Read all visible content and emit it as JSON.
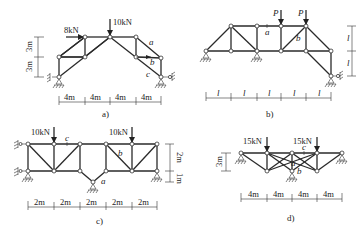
{
  "figure": {
    "panels": [
      {
        "id": "a",
        "caption": "a)",
        "loads": [
          {
            "label": "8kN",
            "direction": "horizontal-right"
          },
          {
            "label": "10kN",
            "direction": "down"
          }
        ],
        "member_labels": [
          "a",
          "b",
          "c"
        ],
        "horizontal_dims": [
          "4m",
          "4m",
          "4m",
          "4m"
        ],
        "vertical_dims": [
          "3m",
          "3m"
        ]
      },
      {
        "id": "b",
        "caption": "b)",
        "loads": [
          {
            "label": "P",
            "direction": "down"
          },
          {
            "label": "P",
            "direction": "down"
          }
        ],
        "member_labels": [
          "a",
          "b"
        ],
        "horizontal_dims": [
          "l",
          "l",
          "l",
          "l",
          "l"
        ],
        "vertical_dims": [
          "l",
          "l"
        ]
      },
      {
        "id": "c",
        "caption": "c)",
        "loads": [
          {
            "label": "10kN",
            "direction": "down"
          },
          {
            "label": "10kN",
            "direction": "down"
          }
        ],
        "member_labels": [
          "c",
          "b",
          "a"
        ],
        "horizontal_dims": [
          "2m",
          "2m",
          "2m",
          "2m",
          "2m"
        ],
        "vertical_dims": [
          "2m",
          "1m"
        ]
      },
      {
        "id": "d",
        "caption": "d)",
        "loads": [
          {
            "label": "15kN",
            "direction": "down"
          },
          {
            "label": "15kN",
            "direction": "down"
          }
        ],
        "member_labels": [
          "c",
          "a",
          "b"
        ],
        "horizontal_dims": [
          "4m",
          "4m",
          "4m",
          "4m"
        ],
        "vertical_dims": [
          "3m"
        ]
      }
    ]
  }
}
